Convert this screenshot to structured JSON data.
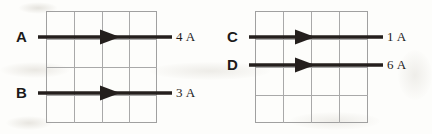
{
  "figure": {
    "type": "physics-current-diagram",
    "background_color": "#fdfdfb",
    "grid_line_color": "#a9a9a9",
    "arrow_color": "#241f1d",
    "text_color": "#1c1a19"
  },
  "panels": [
    {
      "id": "left-panel",
      "grid": {
        "x": 46,
        "y": 11,
        "width": 111,
        "height": 112,
        "columns": 4,
        "rows": 4
      },
      "arrows": [
        {
          "id": "arrow-a",
          "letter": "A",
          "value": "4 A",
          "direction": "right",
          "y": 37,
          "x_start": 38,
          "x_end": 172,
          "head_x": 118
        },
        {
          "id": "arrow-b",
          "letter": "B",
          "value": "3 A",
          "direction": "right",
          "y": 93,
          "x_start": 38,
          "x_end": 172,
          "head_x": 118
        }
      ]
    },
    {
      "id": "right-panel",
      "grid": {
        "x": 255,
        "y": 11,
        "width": 113,
        "height": 112,
        "columns": 4,
        "rows": 4
      },
      "arrows": [
        {
          "id": "arrow-c",
          "letter": "C",
          "value": "1 A",
          "direction": "right",
          "y": 37,
          "x_start": 249,
          "x_end": 383,
          "head_x": 313
        },
        {
          "id": "arrow-d",
          "letter": "D",
          "value": "6 A",
          "direction": "right",
          "y": 65,
          "x_start": 249,
          "x_end": 383,
          "head_x": 313
        }
      ]
    }
  ],
  "labels": {
    "left_letters": [
      "A",
      "B"
    ],
    "left_values": [
      "4 A",
      "3 A"
    ],
    "right_letters": [
      "C",
      "D"
    ],
    "right_values": [
      "1 A",
      "6 A"
    ]
  }
}
